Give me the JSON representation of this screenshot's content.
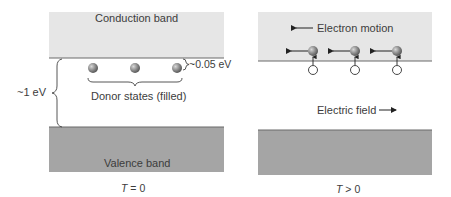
{
  "left_panel": {
    "conduction_band_label": "Conduction band",
    "valence_band_label": "Valence band",
    "gap_label": "~1 eV",
    "donor_gap_label": "~0.05 eV",
    "donor_label": "Donor states (filled)",
    "temperature_label_T": "T",
    "temperature_label_rest": " = 0",
    "donor_count": 3
  },
  "right_panel": {
    "electron_motion_label": "Electron motion",
    "electric_field_label": "Electric field",
    "temperature_label_T": "T",
    "temperature_label_rest": " > 0",
    "electron_count": 3
  },
  "colors": {
    "conduction_band": "#e6e6e6",
    "valence_band": "#a5a5a5",
    "band_edge": "#6a6a6a",
    "electron": "#8c8c8c",
    "text": "#3c3c3c"
  }
}
